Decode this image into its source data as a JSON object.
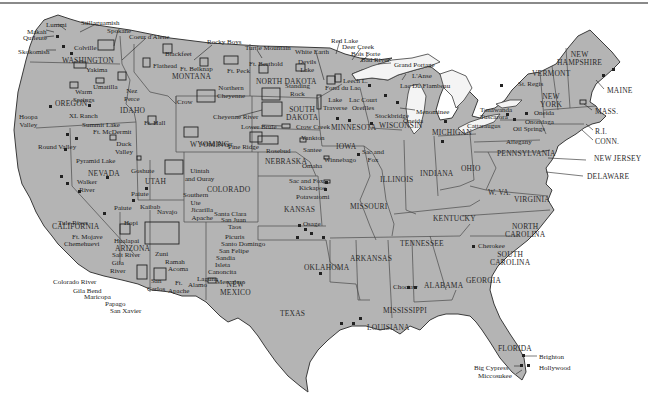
{
  "map": {
    "title": "Native American Reservations in the United States",
    "colors": {
      "land": "#b4b4b4",
      "water": "#ffffff",
      "lake": "#f4f4f4",
      "border": "#3a3a3a",
      "text": "#222222"
    }
  },
  "states": [
    {
      "id": "washington",
      "label": "WASHINGTON",
      "x": 62,
      "y": 57
    },
    {
      "id": "oregon",
      "label": "OREGON",
      "x": 55,
      "y": 100
    },
    {
      "id": "idaho",
      "label": "IDAHO",
      "x": 120,
      "y": 107
    },
    {
      "id": "montana",
      "label": "MONTANA",
      "x": 172,
      "y": 73
    },
    {
      "id": "wyoming",
      "label": "WYOMING",
      "x": 190,
      "y": 141
    },
    {
      "id": "nevada",
      "label": "NEVADA",
      "x": 88,
      "y": 170
    },
    {
      "id": "utah",
      "label": "UTAH",
      "x": 145,
      "y": 178
    },
    {
      "id": "colorado",
      "label": "COLORADO",
      "x": 207,
      "y": 186
    },
    {
      "id": "california",
      "label": "CALIFORNIA",
      "x": 52,
      "y": 223
    },
    {
      "id": "arizona",
      "label": "ARIZONA",
      "x": 115,
      "y": 245
    },
    {
      "id": "new-mexico",
      "label": "NEW\nMEXICO",
      "x": 220,
      "y": 281
    },
    {
      "id": "north-dakota",
      "label": "NORTH DAKOTA",
      "x": 256,
      "y": 78
    },
    {
      "id": "south-dakota",
      "label": "SOUTH\nDAKOTA",
      "x": 286,
      "y": 106
    },
    {
      "id": "nebraska",
      "label": "NEBRASKA",
      "x": 265,
      "y": 158
    },
    {
      "id": "kansas",
      "label": "KANSAS",
      "x": 284,
      "y": 206
    },
    {
      "id": "oklahoma",
      "label": "OKLAHOMA",
      "x": 304,
      "y": 264
    },
    {
      "id": "texas",
      "label": "TEXAS",
      "x": 280,
      "y": 310
    },
    {
      "id": "minnesota",
      "label": "MINNESOTA",
      "x": 331,
      "y": 124
    },
    {
      "id": "iowa",
      "label": "IOWA",
      "x": 336,
      "y": 143
    },
    {
      "id": "missouri",
      "label": "MISSOURI",
      "x": 350,
      "y": 203
    },
    {
      "id": "arkansas",
      "label": "ARKANSAS",
      "x": 350,
      "y": 255
    },
    {
      "id": "louisiana",
      "label": "LOUISIANA",
      "x": 367,
      "y": 324
    },
    {
      "id": "wisconsin",
      "label": "WISCONSIN",
      "x": 379,
      "y": 122
    },
    {
      "id": "illinois",
      "label": "ILLINOIS",
      "x": 380,
      "y": 176
    },
    {
      "id": "mississippi",
      "label": "MISSISSIPPI",
      "x": 383,
      "y": 307
    },
    {
      "id": "michigan",
      "label": "MICHIGAN",
      "x": 432,
      "y": 129
    },
    {
      "id": "indiana",
      "label": "INDIANA",
      "x": 420,
      "y": 170
    },
    {
      "id": "ohio",
      "label": "OHIO",
      "x": 461,
      "y": 165
    },
    {
      "id": "kentucky",
      "label": "KENTUCKY",
      "x": 433,
      "y": 215
    },
    {
      "id": "tennessee",
      "label": "TENNESSEE",
      "x": 400,
      "y": 240
    },
    {
      "id": "alabama",
      "label": "ALABAMA",
      "x": 424,
      "y": 282
    },
    {
      "id": "georgia",
      "label": "GEORGIA",
      "x": 466,
      "y": 277
    },
    {
      "id": "florida",
      "label": "FLORIDA",
      "x": 498,
      "y": 345
    },
    {
      "id": "south-carolina",
      "label": "SOUTH\nCAROLINA",
      "x": 490,
      "y": 251
    },
    {
      "id": "north-carolina",
      "label": "NORTH\nCAROLINA",
      "x": 505,
      "y": 223
    },
    {
      "id": "virginia",
      "label": "VIRGINIA",
      "x": 514,
      "y": 196
    },
    {
      "id": "west-virginia",
      "label": "W. VA.",
      "x": 488,
      "y": 189
    },
    {
      "id": "pennsylvania",
      "label": "PENNSYLVANIA",
      "x": 497,
      "y": 150
    },
    {
      "id": "new-york",
      "label": "NEW\nYORK",
      "x": 540,
      "y": 93
    },
    {
      "id": "vermont",
      "label": "VERMONT",
      "x": 532,
      "y": 70
    },
    {
      "id": "new-hampshire",
      "label": "NEW\nHAMPSHIRE",
      "x": 557,
      "y": 51
    },
    {
      "id": "maine",
      "label": "MAINE",
      "x": 607,
      "y": 87
    },
    {
      "id": "massachusetts",
      "label": "MASS.",
      "x": 595,
      "y": 108
    },
    {
      "id": "rhode-island",
      "label": "R.I.",
      "x": 595,
      "y": 128
    },
    {
      "id": "connecticut",
      "label": "CONN.",
      "x": 595,
      "y": 138
    },
    {
      "id": "new-jersey",
      "label": "NEW JERSEY",
      "x": 594,
      "y": 155
    },
    {
      "id": "delaware",
      "label": "DELAWARE",
      "x": 587,
      "y": 173
    }
  ],
  "reservations": [
    {
      "label": "Lummi",
      "x": 46,
      "y": 21
    },
    {
      "label": "Stillaguamish",
      "x": 81,
      "y": 19
    },
    {
      "label": "Spokane",
      "x": 107,
      "y": 27
    },
    {
      "label": "Coeur d'Alene",
      "x": 129,
      "y": 33
    },
    {
      "label": "Makah",
      "x": 27,
      "y": 28
    },
    {
      "label": "Quileute",
      "x": 23,
      "y": 34
    },
    {
      "label": "Skokomish",
      "x": 18,
      "y": 48
    },
    {
      "label": "Colville",
      "x": 74,
      "y": 44
    },
    {
      "label": "Yakima",
      "x": 86,
      "y": 66
    },
    {
      "label": "Umatilla",
      "x": 93,
      "y": 83
    },
    {
      "label": "Warm\nSprings",
      "x": 73,
      "y": 88
    },
    {
      "label": "Nez\nPerce",
      "x": 124,
      "y": 87
    },
    {
      "label": "Flathead",
      "x": 153,
      "y": 62
    },
    {
      "label": "Blackfeet",
      "x": 165,
      "y": 50
    },
    {
      "label": "Ft. Belknap",
      "x": 180,
      "y": 65
    },
    {
      "label": "Rocky Boys",
      "x": 207,
      "y": 38
    },
    {
      "label": "Ft. Peck",
      "x": 227,
      "y": 67
    },
    {
      "label": "Turtle Mountain",
      "x": 245,
      "y": 44
    },
    {
      "label": "White Earth",
      "x": 295,
      "y": 48
    },
    {
      "label": "Red Lake",
      "x": 331,
      "y": 37
    },
    {
      "label": "Deer Creek",
      "x": 342,
      "y": 43
    },
    {
      "label": "Bois Forte",
      "x": 351,
      "y": 50
    },
    {
      "label": "Bad River",
      "x": 361,
      "y": 56
    },
    {
      "label": "Grand Portage",
      "x": 394,
      "y": 61
    },
    {
      "label": "L'Anse",
      "x": 412,
      "y": 72
    },
    {
      "label": "Lac Du Flambeau",
      "x": 400,
      "y": 82
    },
    {
      "label": "Ft. Berthold",
      "x": 249,
      "y": 60
    },
    {
      "label": "Devils\nLake",
      "x": 298,
      "y": 58
    },
    {
      "label": "Leech L.",
      "x": 343,
      "y": 77
    },
    {
      "label": "Fond du Lac",
      "x": 325,
      "y": 84
    },
    {
      "label": "Northern\nCheyenne",
      "x": 217,
      "y": 84
    },
    {
      "label": "Standing\nRock",
      "x": 285,
      "y": 82
    },
    {
      "label": "Crow",
      "x": 177,
      "y": 98
    },
    {
      "label": "Cheyenne River",
      "x": 213,
      "y": 113
    },
    {
      "label": "Lake\nTraverse",
      "x": 323,
      "y": 96
    },
    {
      "label": "Lac Court\nOreilles",
      "x": 349,
      "y": 96
    },
    {
      "label": "Menominee",
      "x": 416,
      "y": 108
    },
    {
      "label": "Stockbridge",
      "x": 375,
      "y": 112
    },
    {
      "label": "Oneida",
      "x": 403,
      "y": 117
    },
    {
      "label": "Lower Brule",
      "x": 241,
      "y": 123
    },
    {
      "label": "Crow Creek",
      "x": 296,
      "y": 123
    },
    {
      "label": "Wind River",
      "x": 200,
      "y": 140
    },
    {
      "label": "Pine Ridge",
      "x": 228,
      "y": 143
    },
    {
      "label": "Rosebud",
      "x": 266,
      "y": 147
    },
    {
      "label": "Yankton",
      "x": 301,
      "y": 134
    },
    {
      "label": "Santee",
      "x": 303,
      "y": 146
    },
    {
      "label": "Omaha",
      "x": 302,
      "y": 162
    },
    {
      "label": "Winnebago",
      "x": 324,
      "y": 156
    },
    {
      "label": "Sac and\nFox",
      "x": 362,
      "y": 148
    },
    {
      "label": "Sac and Fox",
      "x": 289,
      "y": 177
    },
    {
      "label": "Kickapoo",
      "x": 299,
      "y": 184
    },
    {
      "label": "Potawatomi",
      "x": 296,
      "y": 193
    },
    {
      "label": "Osage",
      "x": 303,
      "y": 220
    },
    {
      "label": "Hoopa\nValley",
      "x": 19,
      "y": 113
    },
    {
      "label": "XL Ranch",
      "x": 69,
      "y": 112
    },
    {
      "label": "Summit Lake",
      "x": 82,
      "y": 121
    },
    {
      "label": "Ft. McDermit",
      "x": 93,
      "y": 128
    },
    {
      "label": "Ft. Hall",
      "x": 144,
      "y": 119
    },
    {
      "label": "Round Valley",
      "x": 38,
      "y": 143
    },
    {
      "label": "Pyramid Lake",
      "x": 76,
      "y": 157
    },
    {
      "label": "Duck\nValley",
      "x": 115,
      "y": 140
    },
    {
      "label": "Goshute",
      "x": 131,
      "y": 167
    },
    {
      "label": "Uintah\nand Ouray",
      "x": 185,
      "y": 167
    },
    {
      "label": "Walker\nRiver",
      "x": 77,
      "y": 178
    },
    {
      "label": "Paiute",
      "x": 131,
      "y": 190
    },
    {
      "label": "Southern\nUte",
      "x": 183,
      "y": 191
    },
    {
      "label": "Paiute",
      "x": 114,
      "y": 204
    },
    {
      "label": "Kaibab",
      "x": 140,
      "y": 203
    },
    {
      "label": "Jicarilla\nApache",
      "x": 191,
      "y": 206
    },
    {
      "label": "Navajo",
      "x": 157,
      "y": 208
    },
    {
      "label": "Hopi",
      "x": 124,
      "y": 219
    },
    {
      "label": "Tule River",
      "x": 58,
      "y": 219
    },
    {
      "label": "Santa Clara",
      "x": 214,
      "y": 210
    },
    {
      "label": "San Juan",
      "x": 221,
      "y": 216
    },
    {
      "label": "Taos",
      "x": 228,
      "y": 223
    },
    {
      "label": "Picuris",
      "x": 225,
      "y": 233
    },
    {
      "label": "Santo Domingo",
      "x": 221,
      "y": 240
    },
    {
      "label": "San Felipe",
      "x": 219,
      "y": 247
    },
    {
      "label": "Ft. Mojave",
      "x": 72,
      "y": 233
    },
    {
      "label": "Chemehuevi",
      "x": 64,
      "y": 240
    },
    {
      "label": "Hualapai",
      "x": 114,
      "y": 237
    },
    {
      "label": "Zuni",
      "x": 155,
      "y": 250
    },
    {
      "label": "Ramah",
      "x": 165,
      "y": 258
    },
    {
      "label": "Acoma",
      "x": 168,
      "y": 265
    },
    {
      "label": "Sandia",
      "x": 216,
      "y": 254
    },
    {
      "label": "Isleta",
      "x": 215,
      "y": 261
    },
    {
      "label": "Canoncita",
      "x": 208,
      "y": 268
    },
    {
      "label": "Laguna",
      "x": 197,
      "y": 275
    },
    {
      "label": "Alamo",
      "x": 188,
      "y": 281
    },
    {
      "label": "Mescalero",
      "x": 216,
      "y": 278
    },
    {
      "label": "Salt River",
      "x": 112,
      "y": 251
    },
    {
      "label": "Gila\nRiver",
      "x": 110,
      "y": 259
    },
    {
      "label": "San\nCarlos",
      "x": 147,
      "y": 277
    },
    {
      "label": "Ft.\nApache",
      "x": 168,
      "y": 279
    },
    {
      "label": "Colorado River",
      "x": 53,
      "y": 278
    },
    {
      "label": "Gila Bend",
      "x": 73,
      "y": 287
    },
    {
      "label": "Maricopa",
      "x": 84,
      "y": 293
    },
    {
      "label": "Papago",
      "x": 105,
      "y": 300
    },
    {
      "label": "San Xavier",
      "x": 110,
      "y": 307
    },
    {
      "label": "Cherokee",
      "x": 478,
      "y": 242
    },
    {
      "label": "Choctaw",
      "x": 393,
      "y": 283
    },
    {
      "label": "St. Regis",
      "x": 518,
      "y": 80
    },
    {
      "label": "Tonawanda",
      "x": 480,
      "y": 106
    },
    {
      "label": "Tuscarora",
      "x": 480,
      "y": 113
    },
    {
      "label": "Oneida",
      "x": 534,
      "y": 109
    },
    {
      "label": "Onondaga",
      "x": 525,
      "y": 118
    },
    {
      "label": "Cattaraugus",
      "x": 467,
      "y": 122
    },
    {
      "label": "Oil Springs",
      "x": 513,
      "y": 125
    },
    {
      "label": "Allegany",
      "x": 506,
      "y": 138
    },
    {
      "label": "Brighton",
      "x": 539,
      "y": 353
    },
    {
      "label": "Hollywood",
      "x": 539,
      "y": 364
    },
    {
      "label": "Big Cypress",
      "x": 474,
      "y": 364
    },
    {
      "label": "Miccosukee",
      "x": 478,
      "y": 372
    }
  ]
}
